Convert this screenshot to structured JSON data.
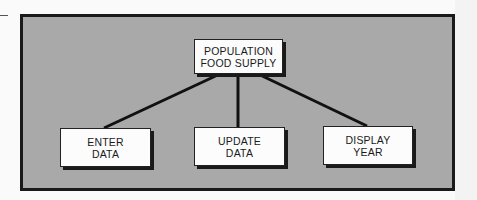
{
  "diagram": {
    "type": "hierarchy",
    "root": {
      "id": "root",
      "label_line1": "POPULATION",
      "label_line2": "FOOD SUPPLY"
    },
    "children": [
      {
        "id": "enter",
        "label_line1": "ENTER",
        "label_line2": "DATA"
      },
      {
        "id": "update",
        "label_line1": "UPDATE",
        "label_line2": "DATA"
      },
      {
        "id": "display",
        "label_line1": "DISPLAY",
        "label_line2": "YEAR"
      }
    ],
    "edges": [
      {
        "from": "root",
        "to": "enter"
      },
      {
        "from": "root",
        "to": "update"
      },
      {
        "from": "root",
        "to": "display"
      }
    ],
    "colors": {
      "panel_background": "#a9a9a9",
      "frame_border": "#1a1a1a",
      "node_fill": "#fcfcfc",
      "connector": "#111111"
    }
  }
}
